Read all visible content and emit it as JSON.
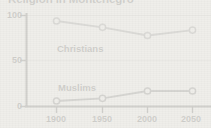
{
  "chart_data": {
    "type": "line",
    "title": "Religion in Montenegro",
    "xlabel": "",
    "ylabel": "",
    "x": [
      1900,
      1950,
      2000,
      2050
    ],
    "categories": [
      "1900",
      "1950",
      "2000",
      "2050"
    ],
    "xlim": [
      1880,
      2070
    ],
    "ylim": [
      0,
      100
    ],
    "yticks": [
      0,
      50,
      100
    ],
    "ytick_labels": [
      "0",
      "50",
      "100"
    ],
    "xtick_labels": [
      "1900",
      "1950",
      "2000",
      "2050"
    ],
    "grid": true,
    "grid_axis": "y",
    "legend": "inline-labels",
    "series": [
      {
        "name": "Christians",
        "label": "Christians",
        "values": [
          94,
          87,
          78,
          84
        ],
        "color": "#6b6b6b",
        "marker": "circle-open"
      },
      {
        "name": "Muslims",
        "label": "Muslims",
        "values": [
          6,
          9,
          17,
          17
        ],
        "color": "#4a4a4a",
        "marker": "circle-open"
      }
    ],
    "annotations": [
      {
        "text": "Christians",
        "x": 1925,
        "y": 70
      },
      {
        "text": "Muslims",
        "x": 1928,
        "y": 30
      }
    ]
  },
  "axes": {
    "y_ticks": [
      {
        "label": "100",
        "value": 100
      },
      {
        "label": "50",
        "value": 50
      },
      {
        "label": "0",
        "value": 0
      }
    ],
    "x_ticks": [
      {
        "label": "1900",
        "value": 1900
      },
      {
        "label": "1950",
        "value": 1950
      },
      {
        "label": "2000",
        "value": 2000
      },
      {
        "label": "2050",
        "value": 2050
      }
    ]
  },
  "colors": {
    "background": "#efeeea",
    "axis": "#262626",
    "grid": "#c9c8c4",
    "christians_line": "#6b6b6b",
    "muslims_line": "#4a4a4a",
    "text": "#1f1f1f"
  }
}
